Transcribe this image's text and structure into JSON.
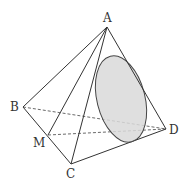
{
  "diagram": {
    "type": "tetrahedron-with-ellipse-section",
    "points": {
      "A": {
        "label": "A",
        "x": 107,
        "y": 27
      },
      "B": {
        "label": "B",
        "x": 23,
        "y": 107
      },
      "C": {
        "label": "C",
        "x": 71,
        "y": 164
      },
      "D": {
        "label": "D",
        "x": 166,
        "y": 129
      },
      "M": {
        "label": "M",
        "x": 48,
        "y": 135
      }
    },
    "solid_edges": [
      "AB",
      "AC",
      "AD",
      "AM",
      "BC",
      "CD"
    ],
    "dashed_edges": [
      "BD",
      "MD"
    ],
    "ellipse": {
      "cx": 121,
      "cy": 99,
      "rx": 24,
      "ry": 44,
      "rotate": -14,
      "fill": "#d9d9d9",
      "stroke": "#444444"
    },
    "colors": {
      "line": "#333333"
    }
  }
}
